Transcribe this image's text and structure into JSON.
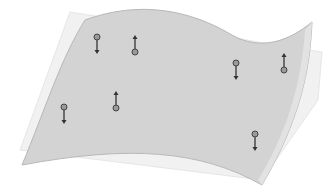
{
  "diagram": {
    "colors": {
      "background": "#ffffff",
      "surface_fill": "#d2d2d2",
      "surface_edge": "#b4b4b4",
      "plane_fill": "#efefef",
      "plane_edge": "#e4e4e4",
      "arrow": "#333333",
      "point_fill": "#9a9a9a",
      "point_stroke": "#444444"
    },
    "vectors": [
      {
        "x": 97,
        "y": 37,
        "direction": "down"
      },
      {
        "x": 135,
        "y": 52,
        "direction": "up"
      },
      {
        "x": 236,
        "y": 63,
        "direction": "down"
      },
      {
        "x": 284,
        "y": 70,
        "direction": "up"
      },
      {
        "x": 64,
        "y": 107,
        "direction": "down"
      },
      {
        "x": 116,
        "y": 108,
        "direction": "up"
      },
      {
        "x": 255,
        "y": 134,
        "direction": "down"
      }
    ]
  }
}
